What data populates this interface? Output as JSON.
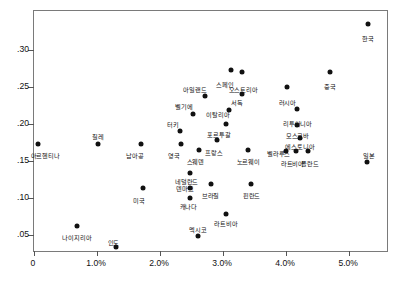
{
  "chart_data": {
    "type": "scatter",
    "title": "",
    "xlabel": "",
    "ylabel": "",
    "xlim": [
      0,
      5.6
    ],
    "ylim": [
      0.028,
      0.352
    ],
    "grid": false,
    "legend": null,
    "xticks": [
      "0",
      "1.0%",
      "2.0%",
      "3.0%",
      "4.0%",
      "5.0%"
    ],
    "xtick_values": [
      0,
      1.0,
      2.0,
      3.0,
      4.0,
      5.0
    ],
    "yticks": [
      ".05",
      ".10",
      ".15",
      ".20",
      ".25",
      ".30"
    ],
    "ytick_values": [
      0.05,
      0.1,
      0.15,
      0.2,
      0.25,
      0.3
    ],
    "ytick_shown": [
      ".05",
      ".10",
      ".15",
      ".20",
      ".25",
      ".30"
    ],
    "points": [
      {
        "label": "한국",
        "x": 5.3,
        "y": 0.335,
        "lx": 5.3,
        "ly": 0.318
      },
      {
        "label": "중국",
        "x": 4.7,
        "y": 0.27,
        "lx": 4.7,
        "ly": 0.253
      },
      {
        "label": "스페인",
        "x": 3.12,
        "y": 0.272,
        "lx": 3.03,
        "ly": 0.256
      },
      {
        "label": "오스트리아",
        "x": 3.3,
        "y": 0.27,
        "lx": 3.32,
        "ly": 0.25
      },
      {
        "label": "서독",
        "x": 3.3,
        "y": 0.24,
        "lx": 3.22,
        "ly": 0.232
      },
      {
        "label": "러시아",
        "x": 4.02,
        "y": 0.25,
        "lx": 4.02,
        "ly": 0.232
      },
      {
        "label": "아일랜드",
        "x": 2.72,
        "y": 0.237,
        "lx": 2.55,
        "ly": 0.25
      },
      {
        "label": "이탈리아",
        "x": 3.1,
        "y": 0.218,
        "lx": 2.92,
        "ly": 0.215
      },
      {
        "label": "리투아니아",
        "x": 4.18,
        "y": 0.22,
        "lx": 4.18,
        "ly": 0.203
      },
      {
        "label": "벨기에",
        "x": 2.52,
        "y": 0.213,
        "lx": 2.38,
        "ly": 0.226
      },
      {
        "label": "모스크바",
        "x": 4.18,
        "y": 0.198,
        "lx": 4.18,
        "ly": 0.187
      },
      {
        "label": "포르투갈",
        "x": 3.05,
        "y": 0.2,
        "lx": 2.93,
        "ly": 0.188
      },
      {
        "label": "터키",
        "x": 2.32,
        "y": 0.19,
        "lx": 2.2,
        "ly": 0.202
      },
      {
        "label": "에스토니아",
        "x": 4.22,
        "y": 0.18,
        "lx": 4.22,
        "ly": 0.172
      },
      {
        "label": "벨라루스",
        "x": 4.0,
        "y": 0.163,
        "lx": 3.88,
        "ly": 0.163
      },
      {
        "label": "라트비아",
        "x": 4.16,
        "y": 0.163,
        "lx": 4.1,
        "ly": 0.15
      },
      {
        "label": "폴란드",
        "x": 4.35,
        "y": 0.163,
        "lx": 4.38,
        "ly": 0.15
      },
      {
        "label": "일본",
        "x": 5.28,
        "y": 0.148,
        "lx": 5.32,
        "ly": 0.16
      },
      {
        "label": "칠레",
        "x": 1.02,
        "y": 0.172,
        "lx": 1.02,
        "ly": 0.186
      },
      {
        "label": "아르헨티나",
        "x": 0.06,
        "y": 0.172,
        "lx": 0.18,
        "ly": 0.16
      },
      {
        "label": "남아공",
        "x": 1.7,
        "y": 0.172,
        "lx": 1.6,
        "ly": 0.16
      },
      {
        "label": "영국",
        "x": 2.33,
        "y": 0.172,
        "lx": 2.22,
        "ly": 0.16
      },
      {
        "label": "스웨덴",
        "x": 2.62,
        "y": 0.165,
        "lx": 2.56,
        "ly": 0.152
      },
      {
        "label": "프랑스",
        "x": 2.9,
        "y": 0.178,
        "lx": 2.86,
        "ly": 0.165
      },
      {
        "label": "노르웨이",
        "x": 3.4,
        "y": 0.165,
        "lx": 3.4,
        "ly": 0.152
      },
      {
        "label": "네덜란드",
        "x": 2.48,
        "y": 0.133,
        "lx": 2.42,
        "ly": 0.125
      },
      {
        "label": "덴마크",
        "x": 2.48,
        "y": 0.113,
        "lx": 2.4,
        "ly": 0.116
      },
      {
        "label": "캐나다",
        "x": 2.48,
        "y": 0.1,
        "lx": 2.45,
        "ly": 0.091
      },
      {
        "label": "브라질",
        "x": 2.8,
        "y": 0.118,
        "lx": 2.8,
        "ly": 0.106
      },
      {
        "label": "핀란드",
        "x": 3.45,
        "y": 0.118,
        "lx": 3.45,
        "ly": 0.106
      },
      {
        "label": "미국",
        "x": 1.73,
        "y": 0.113,
        "lx": 1.66,
        "ly": 0.1
      },
      {
        "label": "라트비아",
        "x": 3.05,
        "y": 0.078,
        "lx": 3.05,
        "ly": 0.068
      },
      {
        "label": "나이지리아",
        "x": 0.68,
        "y": 0.062,
        "lx": 0.68,
        "ly": 0.05
      },
      {
        "label": "멕시코",
        "x": 2.6,
        "y": 0.048,
        "lx": 2.6,
        "ly": 0.06
      },
      {
        "label": "인도",
        "x": 1.3,
        "y": 0.034,
        "lx": 1.26,
        "ly": 0.043
      }
    ]
  }
}
